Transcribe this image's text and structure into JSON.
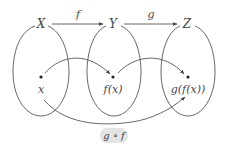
{
  "diagram": {
    "sets": [
      {
        "name": "X",
        "cx": 41,
        "cy": 70,
        "rx": 28,
        "ry": 46
      },
      {
        "name": "Y",
        "cx": 114,
        "cy": 70,
        "rx": 27,
        "ry": 46
      },
      {
        "name": "Z",
        "cx": 188,
        "cy": 70,
        "rx": 27,
        "ry": 46
      }
    ],
    "top_arrows": [
      {
        "label": "f",
        "from": "X",
        "to": "Y"
      },
      {
        "label": "g",
        "from": "Y",
        "to": "Z"
      }
    ],
    "elements": [
      {
        "label": "x",
        "set": "X"
      },
      {
        "label": "f(x)",
        "set": "Y"
      },
      {
        "label": "g(f(x))",
        "set": "Z"
      }
    ],
    "composition": {
      "label": "g ∘ f",
      "from": "x",
      "to": "g(f(x))"
    },
    "colors": {
      "stroke": "#555555",
      "text": "#444444",
      "pill": "#e4e4e4"
    }
  }
}
